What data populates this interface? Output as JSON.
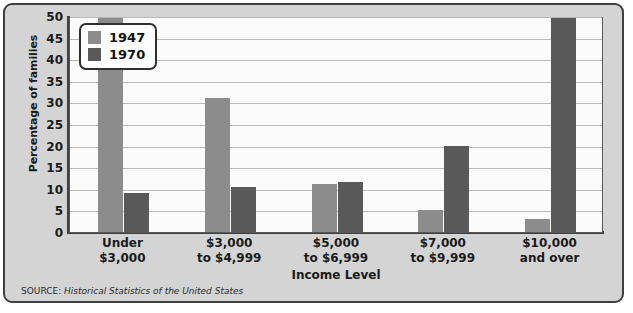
{
  "chart_data": {
    "type": "bar",
    "title": "",
    "xlabel": "Income Level",
    "ylabel": "Percentage of families",
    "categories": [
      "Under\n$3,000",
      "$3,000\nto $4,999",
      "$5,000\nto $6,999",
      "$7,000\nto $9,999",
      "$10,000\nand over"
    ],
    "category_lines": [
      [
        "Under",
        "$3,000"
      ],
      [
        "$3,000",
        "to $4,999"
      ],
      [
        "$5,000",
        "to $6,999"
      ],
      [
        "$7,000",
        "to $9,999"
      ],
      [
        "$10,000",
        "and over"
      ]
    ],
    "series": [
      {
        "name": "1947",
        "color": "#8c8c8c",
        "values": [
          49.5,
          31,
          11,
          5,
          3
        ]
      },
      {
        "name": "1970",
        "color": "#595959",
        "values": [
          9,
          10.5,
          11.5,
          20,
          49.5
        ]
      }
    ],
    "ylim": [
      0,
      50
    ],
    "yticks": [
      0,
      5,
      10,
      15,
      20,
      25,
      30,
      35,
      40,
      45,
      50
    ],
    "grid": true,
    "legend_position": "upper-left-inside"
  },
  "source": {
    "prefix": "SOURCE:",
    "text": "Historical Statistics of the United States"
  }
}
